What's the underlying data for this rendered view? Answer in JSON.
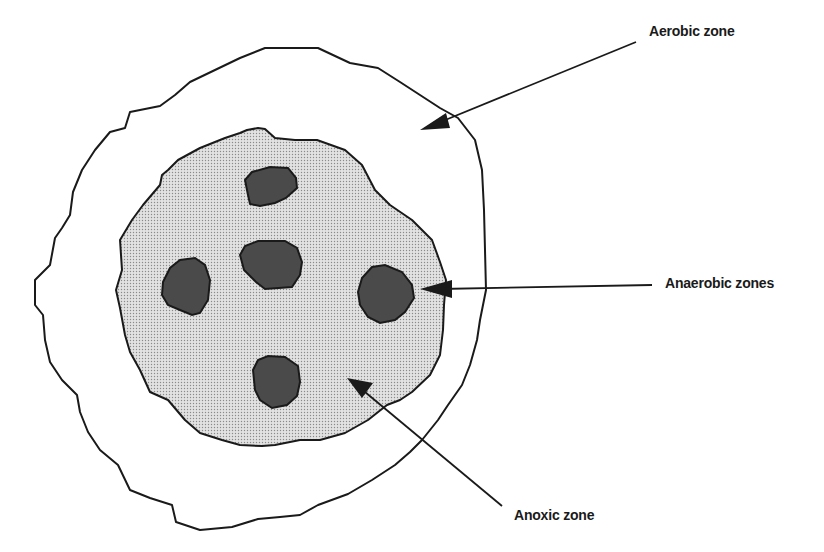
{
  "diagram": {
    "type": "floc cross-section zones",
    "labels": {
      "aerobic": "Aerobic zone",
      "anaerobic": "Anaerobic zones",
      "anoxic": "Anoxic zone"
    },
    "colors": {
      "outline": "#1a1a1a",
      "aerobic_fill": "#ffffff",
      "anoxic_fill": "#d4d4d4",
      "anaerobic_fill": "#4a4a4a"
    },
    "anaerobic_zone_count": 5
  }
}
